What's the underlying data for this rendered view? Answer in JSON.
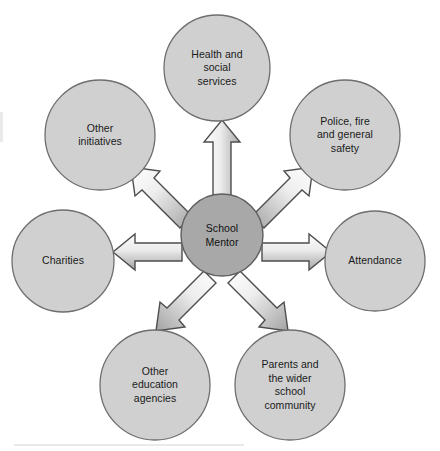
{
  "diagram": {
    "type": "hub-and-spoke",
    "colors": {
      "background": "#ffffff",
      "node_fill": "#d0d0d0",
      "node_stroke": "#6e6e6e",
      "center_fill": "#a8a8a8",
      "center_stroke": "#5f5f5f",
      "arrow_fill_light": "#fdfdfd",
      "arrow_fill_dark": "#a9a9a9",
      "arrow_stroke": "#4d4d4d",
      "text": "#1a1a1a"
    },
    "center": {
      "id": "school-mentor",
      "label": "School\nMentor",
      "cx": 222,
      "cy": 235,
      "r": 41
    },
    "nodes": [
      {
        "id": "health-and-social-services",
        "label": "Health and\nsocial\nservices",
        "cx": 217,
        "cy": 68,
        "r": 53,
        "angle_deg": 90
      },
      {
        "id": "police-fire-and-general-safety",
        "label": "Police, fire\nand general\nsafety",
        "cx": 345,
        "cy": 135,
        "r": 55,
        "angle_deg": 27
      },
      {
        "id": "attendance",
        "label": "Attendance",
        "cx": 375,
        "cy": 261,
        "r": 50,
        "angle_deg": -12
      },
      {
        "id": "parents-and-the-wider-school-community",
        "label": "Parents and\nthe wider\nschool\ncommunity",
        "cx": 290,
        "cy": 385,
        "r": 55,
        "angle_deg": -62
      },
      {
        "id": "other-education-agencies",
        "label": "Other\neducation\nagencies",
        "cx": 155,
        "cy": 385,
        "r": 55,
        "angle_deg": -118
      },
      {
        "id": "charities",
        "label": "Charities",
        "cx": 63,
        "cy": 261,
        "r": 51,
        "angle_deg": 192
      },
      {
        "id": "other-initiatives",
        "label": "Other\ninitiatives",
        "cx": 100,
        "cy": 135,
        "r": 55,
        "angle_deg": 153
      }
    ],
    "arrows": [
      {
        "id": "arrow-to-health-and-social-services",
        "from": "school-mentor",
        "to": "health-and-social-services",
        "direction": "up"
      },
      {
        "id": "arrow-to-police-fire-and-general-safety",
        "from": "school-mentor",
        "to": "police-fire-and-general-safety",
        "direction": "up-right"
      },
      {
        "id": "arrow-to-attendance",
        "from": "school-mentor",
        "to": "attendance",
        "direction": "right"
      },
      {
        "id": "arrow-to-parents-and-the-wider-school-community",
        "from": "school-mentor",
        "to": "parents-and-the-wider-school-community",
        "direction": "down-right"
      },
      {
        "id": "arrow-to-other-education-agencies",
        "from": "school-mentor",
        "to": "other-education-agencies",
        "direction": "down-left"
      },
      {
        "id": "arrow-to-charities",
        "from": "school-mentor",
        "to": "charities",
        "direction": "left"
      },
      {
        "id": "arrow-to-other-initiatives",
        "from": "school-mentor",
        "to": "other-initiatives",
        "direction": "up-left"
      }
    ]
  }
}
